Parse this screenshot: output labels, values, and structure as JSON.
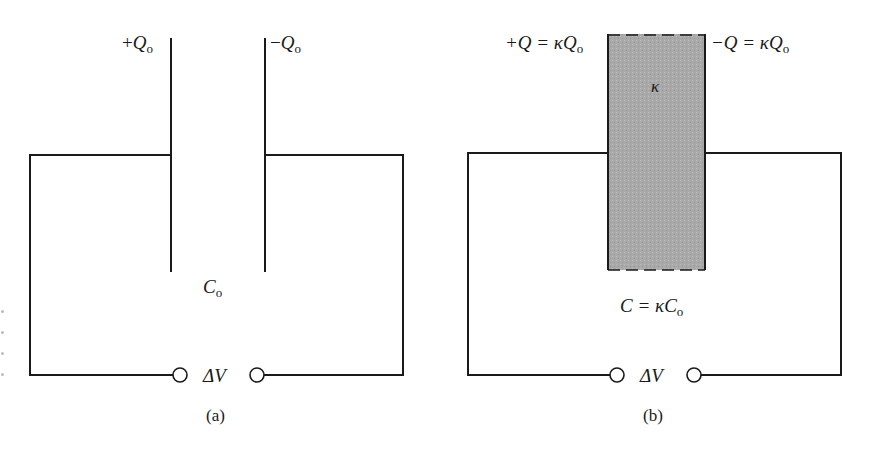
{
  "figure": {
    "panel_a": {
      "caption": "(a)",
      "left_plate_charge": {
        "sign": "+",
        "symbol": "Q",
        "subscript": "o"
      },
      "right_plate_charge": {
        "sign": "−",
        "symbol": "Q",
        "subscript": "o"
      },
      "capacitance": {
        "symbol": "C",
        "subscript": "o"
      },
      "voltage": "ΔV"
    },
    "panel_b": {
      "caption": "(b)",
      "left_plate_charge": {
        "prefix": "+Q = κ",
        "symbol": "Q",
        "subscript": "o"
      },
      "right_plate_charge": {
        "prefix": "−Q = κ",
        "symbol": "Q",
        "subscript": "o"
      },
      "dielectric_label": "κ",
      "capacitance": {
        "prefix": "C = κ",
        "symbol": "C",
        "subscript": "o"
      },
      "voltage": "ΔV",
      "dielectric_color": "#a8a8a8"
    },
    "line_color": "#1a1a1a"
  }
}
